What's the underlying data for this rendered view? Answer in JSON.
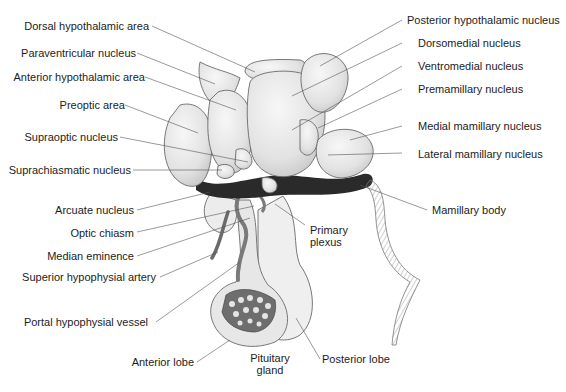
{
  "figure": {
    "colors": {
      "nucleus_fill": "#e6e6e6",
      "nucleus_stroke": "#6a6a6a",
      "dark_tissue": "#2a2a2a",
      "vessel": "#7a7a7a",
      "gland_fill": "#ececec",
      "leader_line": "#555555",
      "text": "#1c1c1c"
    }
  },
  "labels": {
    "left": [
      {
        "id": "dorsal-hypothalamic-area",
        "text": "Dorsal hypothalamic area"
      },
      {
        "id": "paraventricular-nucleus",
        "text": "Paraventricular nucleus"
      },
      {
        "id": "anterior-hypothalamic-area",
        "text": "Anterior hypothalamic area"
      },
      {
        "id": "preoptic-area",
        "text": "Preoptic area"
      },
      {
        "id": "supraoptic-nucleus",
        "text": "Supraoptic nucleus"
      },
      {
        "id": "suprachiasmatic-nucleus",
        "text": "Suprachiasmatic nucleus"
      },
      {
        "id": "arcuate-nucleus",
        "text": "Arcuate nucleus"
      },
      {
        "id": "optic-chiasm",
        "text": "Optic chiasm"
      },
      {
        "id": "median-eminence",
        "text": "Median eminence"
      },
      {
        "id": "superior-hypophysial-artery",
        "text": "Superior hypophysial artery"
      },
      {
        "id": "portal-hypophysial-vessel",
        "text": "Portal hypophysial vessel"
      },
      {
        "id": "anterior-lobe",
        "text": "Anterior lobe"
      }
    ],
    "right": [
      {
        "id": "posterior-hypothalamic-nucleus",
        "text": "Posterior hypothalamic nucleus"
      },
      {
        "id": "dorsomedial-nucleus",
        "text": "Dorsomedial nucleus"
      },
      {
        "id": "ventromedial-nucleus",
        "text": "Ventromedial nucleus"
      },
      {
        "id": "premamillary-nucleus",
        "text": "Premamillary nucleus"
      },
      {
        "id": "medial-mamillary-nucleus",
        "text": "Medial mamillary nucleus"
      },
      {
        "id": "lateral-mamillary-nucleus",
        "text": "Lateral mamillary nucleus"
      },
      {
        "id": "mamillary-body",
        "text": "Mamillary body"
      },
      {
        "id": "posterior-lobe",
        "text": "Posterior lobe"
      }
    ],
    "center": [
      {
        "id": "primary-plexus",
        "line1": "Primary",
        "line2": "plexus"
      },
      {
        "id": "pituitary-gland",
        "line1": "Pituitary",
        "line2": "gland"
      }
    ]
  }
}
